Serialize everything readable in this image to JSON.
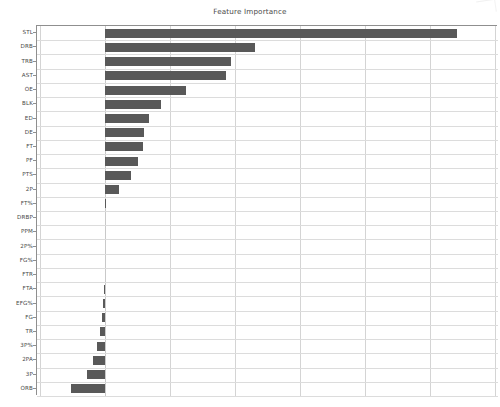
{
  "chart_data": {
    "type": "bar",
    "orientation": "horizontal",
    "title": "Feature Importance",
    "xlabel": "",
    "ylabel": "",
    "grid": true,
    "legend": null,
    "bar_color": "#595959",
    "xlim": [
      -0.0105,
      0.0605
    ],
    "xticks": [
      -0.01,
      0.0,
      0.01,
      0.02,
      0.03,
      0.04,
      0.05,
      0.06
    ],
    "xtick_labels": [
      "",
      "",
      "",
      "",
      "",
      "",
      "",
      ""
    ],
    "categories": [
      "STL",
      "DRB",
      "TRB",
      "AST",
      "OE",
      "BLK",
      "ED",
      "DE",
      "FT",
      "PF",
      "PTS",
      "2P",
      "FT%",
      "DRBP",
      "PPM",
      "2P%",
      "FG%",
      "FTR",
      "FTA",
      "EFG%",
      "FG",
      "TR",
      "3P%",
      "2PA",
      "3P",
      "ORB"
    ],
    "values": [
      0.0542,
      0.023,
      0.0194,
      0.0186,
      0.0125,
      0.0086,
      0.0067,
      0.006,
      0.0058,
      0.005,
      0.004,
      0.0022,
      0.0002,
      0.0,
      0.0,
      0.0,
      0.0,
      0.0,
      -0.0002,
      -0.0004,
      -0.0005,
      -0.0008,
      -0.0012,
      -0.0018,
      -0.0028,
      -0.0053
    ],
    "series": [
      {
        "name": "importance",
        "values": [
          0.0542,
          0.023,
          0.0194,
          0.0186,
          0.0125,
          0.0086,
          0.0067,
          0.006,
          0.0058,
          0.005,
          0.004,
          0.0022,
          0.0002,
          0.0,
          0.0,
          0.0,
          0.0,
          0.0,
          -0.0002,
          -0.0004,
          -0.0005,
          -0.0008,
          -0.0012,
          -0.0018,
          -0.0028,
          -0.0053
        ]
      }
    ]
  },
  "figure": {
    "title": "Feature Importance"
  }
}
